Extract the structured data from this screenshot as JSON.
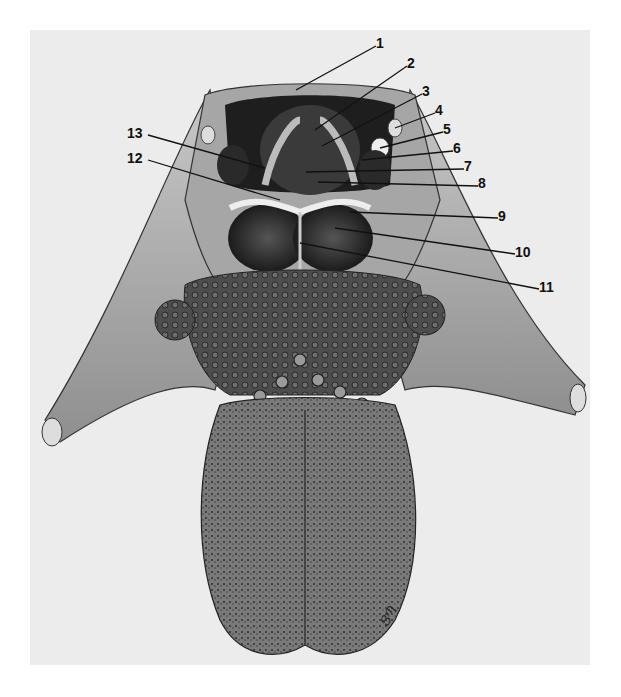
{
  "figure": {
    "labels": [
      {
        "id": "1",
        "text": "1",
        "x": 376,
        "y": 40
      },
      {
        "id": "2",
        "text": "2",
        "x": 407,
        "y": 60
      },
      {
        "id": "3",
        "text": "3",
        "x": 422,
        "y": 88
      },
      {
        "id": "4",
        "text": "4",
        "x": 435,
        "y": 107
      },
      {
        "id": "5",
        "text": "5",
        "x": 443,
        "y": 126
      },
      {
        "id": "6",
        "text": "6",
        "x": 453,
        "y": 145
      },
      {
        "id": "7",
        "text": "7",
        "x": 464,
        "y": 163
      },
      {
        "id": "8",
        "text": "8",
        "x": 478,
        "y": 180
      },
      {
        "id": "9",
        "text": "9",
        "x": 498,
        "y": 213
      },
      {
        "id": "10",
        "text": "10",
        "x": 515,
        "y": 249
      },
      {
        "id": "11",
        "text": "11",
        "x": 539,
        "y": 284
      },
      {
        "id": "12",
        "text": "12",
        "x": 127,
        "y": 155
      },
      {
        "id": "13",
        "text": "13",
        "x": 127,
        "y": 130
      }
    ],
    "signature": "ՑՊ",
    "colors": {
      "background": "#ececec",
      "ink": "#1a1a1a",
      "tissue_light": "#bdbdbd",
      "tissue_mid": "#8a8a8a",
      "tissue_dark": "#3a3a3a"
    }
  }
}
